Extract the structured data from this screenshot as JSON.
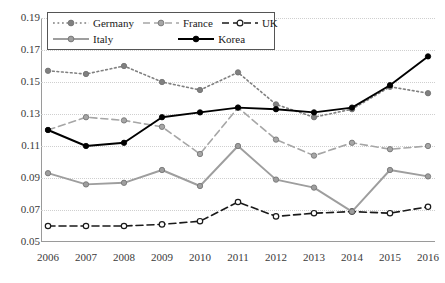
{
  "chart_data": {
    "type": "line",
    "title": "",
    "xlabel": "",
    "ylabel": "",
    "categories": [
      "2006",
      "2007",
      "2008",
      "2009",
      "2010",
      "2011",
      "2012",
      "2013",
      "2014",
      "2015",
      "2016"
    ],
    "x": [
      2006,
      2007,
      2008,
      2009,
      2010,
      2011,
      2012,
      2013,
      2014,
      2015,
      2016
    ],
    "ylim": [
      0.05,
      0.19
    ],
    "yticks": [
      "0.05",
      "0.07",
      "0.09",
      "0.11",
      "0.13",
      "0.15",
      "0.17",
      "0.19"
    ],
    "ytick_values": [
      0.05,
      0.07,
      0.09,
      0.11,
      0.13,
      0.15,
      0.17,
      0.19
    ],
    "grid": true,
    "legend_position": "top-left-inside",
    "series": [
      {
        "name": "Germany",
        "color": "#808080",
        "line_style": "dotted",
        "marker": "filled-circle",
        "values": [
          0.157,
          0.155,
          0.16,
          0.15,
          0.145,
          0.156,
          0.136,
          0.128,
          0.133,
          0.147,
          0.143
        ]
      },
      {
        "name": "France",
        "color": "#a6a6a6",
        "line_style": "dashed",
        "marker": "filled-circle",
        "values": [
          0.12,
          0.128,
          0.126,
          0.122,
          0.105,
          0.134,
          0.114,
          0.104,
          0.112,
          0.108,
          0.11
        ]
      },
      {
        "name": "UK",
        "color": "#1a1a1a",
        "line_style": "dashed",
        "marker": "open-circle",
        "values": [
          0.06,
          0.06,
          0.06,
          0.061,
          0.063,
          0.075,
          0.066,
          0.068,
          0.069,
          0.068,
          0.072
        ]
      },
      {
        "name": "Italy",
        "color": "#9e9e9e",
        "line_style": "solid",
        "marker": "filled-circle",
        "values": [
          0.093,
          0.086,
          0.087,
          0.095,
          0.085,
          0.11,
          0.089,
          0.084,
          0.069,
          0.095,
          0.091
        ]
      },
      {
        "name": "Korea",
        "color": "#000000",
        "line_style": "solid",
        "marker": "filled-circle",
        "values": [
          0.12,
          0.11,
          0.112,
          0.128,
          0.131,
          0.134,
          0.133,
          0.131,
          0.134,
          0.148,
          0.166
        ]
      }
    ]
  }
}
